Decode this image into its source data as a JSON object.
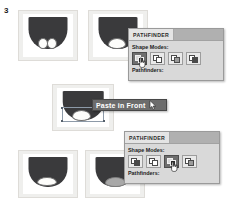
{
  "figure": {
    "step_number": "3"
  },
  "artboards": [
    {
      "name": "artboard-top-left",
      "shape_fill": "#3a3a3c",
      "circles_fill": "#fdfdfb",
      "description": "two white circles overlapping bottom of dark dome"
    },
    {
      "name": "artboard-top-right",
      "shape_fill": "#3a3a3c",
      "circles_fill": "#fdfdfb",
      "description": "circles united into one white blob"
    },
    {
      "name": "artboard-middle",
      "shape_fill": "#3a3a3c",
      "circles_fill": "#fdfdfb",
      "description": "white blob selected with bounding box"
    },
    {
      "name": "artboard-bottom-left",
      "shape_fill": "#3a3a3c",
      "circles_fill": "#fdfdfb",
      "description": "white blob merged flush with dome base"
    },
    {
      "name": "artboard-bottom-right",
      "shape_fill": "#3a3a3c",
      "circles_fill": "#a8a8a8",
      "description": "blob knocked out showing gray shape"
    }
  ],
  "pathfinder_panel_top": {
    "tab_label": "PATHFINDER",
    "shape_modes_label": "Shape Modes:",
    "pathfinders_label": "Pathfinders:",
    "buttons": [
      {
        "label": "Unite",
        "active": true
      },
      {
        "label": "Minus Front",
        "active": false
      },
      {
        "label": "Intersect",
        "active": false
      },
      {
        "label": "Exclude",
        "active": false
      }
    ]
  },
  "tooltip": {
    "label": "Paste in Front",
    "cursor_icon": "arrow-cursor-icon"
  },
  "pathfinder_panel_bottom": {
    "tab_label": "PATHFINDER",
    "shape_modes_label": "Shape Modes:",
    "pathfinders_label": "Pathfinders:",
    "buttons": [
      {
        "label": "Unite",
        "active": false
      },
      {
        "label": "Minus Front",
        "active": false
      },
      {
        "label": "Intersect",
        "active": true
      },
      {
        "label": "Exclude",
        "active": false
      }
    ]
  },
  "colors": {
    "panel_background": "#d9d9d9",
    "panel_titlebar": "#b0b0b0",
    "tab_background": "#e4e4e4",
    "tooltip_background": "#6c6c6c",
    "artboard_background": "#efefed",
    "shape_dark": "#3a3a3c",
    "shape_white": "#fdfdfb",
    "shape_gray": "#a8a8a8",
    "active_button": "#6e6e6e"
  }
}
